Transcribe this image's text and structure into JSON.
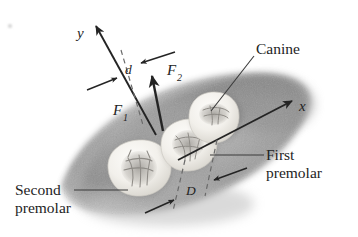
{
  "figure": {
    "background_color": "#ffffff",
    "ink_color": "#242424",
    "gum_color": "#9a9a9a",
    "gum_shadow_color": "#6f6f6f",
    "tooth_color": "#f4f2ed",
    "tooth_detail_color": "#a8a6a1"
  },
  "axes": {
    "y_label": "y",
    "x_label": "x"
  },
  "forces": {
    "f1_label": "F",
    "f1_sub": "1",
    "f2_label": "F",
    "f2_sub": "2"
  },
  "dimensions": {
    "d_label": "d",
    "big_d_label": "D"
  },
  "callouts": {
    "canine": "Canine",
    "first_premolar_line1": "First",
    "first_premolar_line2": "premolar",
    "second_premolar_line1": "Second",
    "second_premolar_line2": "premolar"
  },
  "teeth": [
    {
      "name": "second-premolar",
      "cx": 139,
      "cy": 167
    },
    {
      "name": "first-premolar",
      "cx": 189,
      "cy": 143
    },
    {
      "name": "canine",
      "cx": 216,
      "cy": 115
    }
  ]
}
